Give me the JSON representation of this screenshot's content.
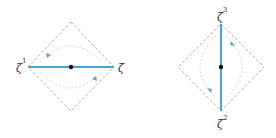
{
  "colors": {
    "background": "#ffffff",
    "diamond_stroke": "#9a9a9a",
    "arc_stroke": "#d4d4d4",
    "line_stroke": "#4aa3d3",
    "arrow_fill": "#5aa9d6",
    "center_dot": "#111111",
    "label": "#333333"
  },
  "diagrams": [
    {
      "id": "horizontal",
      "orientation": "horizontal",
      "labels": [
        {
          "base": "ζ",
          "sup": "1",
          "position": "left"
        },
        {
          "base": "ζ",
          "sup": "",
          "position": "right"
        }
      ],
      "arrows": [
        {
          "position": "upper-left",
          "direction": "down-left"
        },
        {
          "position": "lower-right",
          "direction": "up-right"
        }
      ]
    },
    {
      "id": "vertical",
      "orientation": "vertical",
      "labels": [
        {
          "base": "ζ",
          "sup": "3",
          "position": "top"
        },
        {
          "base": "ζ",
          "sup": "2",
          "position": "bottom"
        }
      ],
      "arrows": [
        {
          "position": "upper-right",
          "direction": "up-left"
        },
        {
          "position": "lower-left",
          "direction": "down-right"
        }
      ]
    }
  ]
}
